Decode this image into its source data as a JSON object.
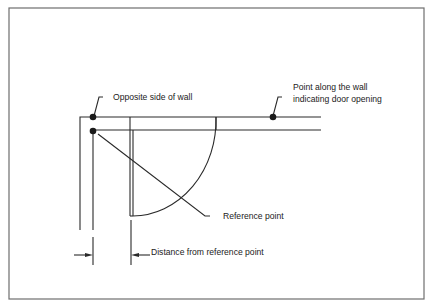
{
  "figure": {
    "type": "floor-plan door measurement diagram",
    "colors": {
      "line": "#2a2a2a",
      "frame": "#6e6e6e",
      "background": "#ffffff"
    },
    "labels": {
      "opposite_side": "Opposite side of wall",
      "door_point_line1": "Point along the wall",
      "door_point_line2": "indicating door opening",
      "reference_point": "Reference point",
      "distance": "Distance from reference point"
    }
  }
}
